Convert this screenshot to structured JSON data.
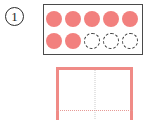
{
  "exercise": {
    "number_label": "1",
    "marker_shape": "circled-number"
  },
  "counter_box": {
    "total_slots": 10,
    "filled_count": 7,
    "outline_count": 3,
    "fill_color": "#f2807e",
    "outline_color": "#3a3a3a",
    "border_color": "#4a4a4a",
    "rows": [
      {
        "row_index": 1,
        "dots": [
          {
            "state": "filled"
          },
          {
            "state": "filled"
          },
          {
            "state": "filled"
          },
          {
            "state": "filled"
          },
          {
            "state": "filled"
          }
        ]
      },
      {
        "row_index": 2,
        "dots": [
          {
            "state": "filled"
          },
          {
            "state": "filled"
          },
          {
            "state": "outline"
          },
          {
            "state": "outline"
          },
          {
            "state": "outline"
          }
        ]
      }
    ]
  },
  "answer_rect": {
    "border_color": "#f08b87",
    "vertical_guide_color": "#c9c9c9",
    "horizontal_guide_color": "#e79a96",
    "guide_style": "dotted"
  }
}
